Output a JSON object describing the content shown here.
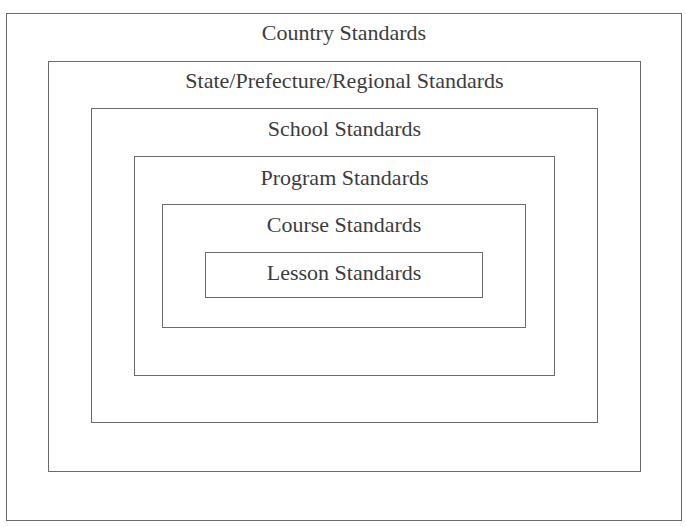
{
  "diagram": {
    "levels": [
      {
        "label": "Country Standards"
      },
      {
        "label": "State/Prefecture/Regional Standards"
      },
      {
        "label": "School Standards"
      },
      {
        "label": "Program Standards"
      },
      {
        "label": "Course Standards"
      },
      {
        "label": "Lesson Standards"
      }
    ]
  }
}
